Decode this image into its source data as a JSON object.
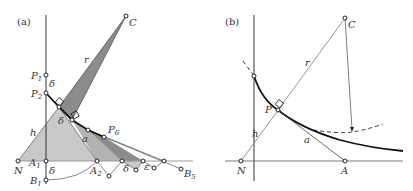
{
  "panels": [
    {
      "id": "a",
      "label": "(a)",
      "points": {
        "C": "C",
        "P1": "P",
        "P1_sub": "1",
        "P2": "P",
        "P2_sub": "2",
        "P6": "P",
        "P6_sub": "6",
        "N": "N",
        "A1": "A",
        "A1_sub": "1",
        "A2": "A",
        "A2_sub": "2",
        "B1": "B",
        "B1_sub": "1",
        "B5": "B",
        "B5_sub": "5"
      },
      "segments": {
        "r": "r",
        "h": "h",
        "a": "a",
        "delta": "δ",
        "epsilon": "ε"
      }
    },
    {
      "id": "b",
      "label": "(b)",
      "points": {
        "C": "C",
        "P": "P",
        "N": "N",
        "A": "A"
      },
      "segments": {
        "r": "r",
        "h": "h",
        "a": "a"
      }
    }
  ],
  "colors": {
    "light_fill": "#c8c8c8",
    "dark_fill": "#8a8a8a",
    "mid_fill": "#a9a9a9",
    "line": "#222222",
    "thin_line": "#555555"
  }
}
